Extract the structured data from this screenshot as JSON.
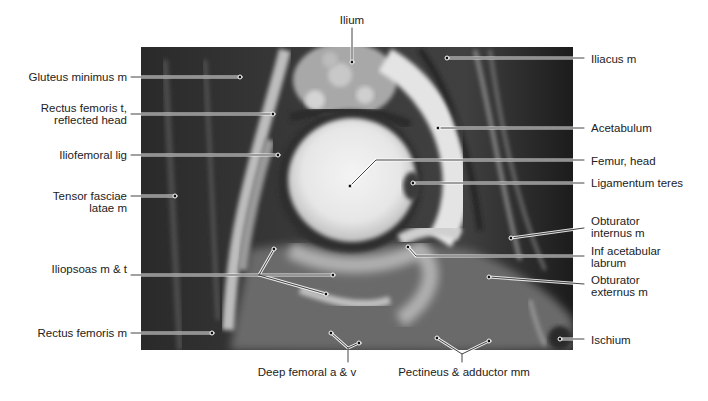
{
  "figure": {
    "type": "MRI coronal hip anatomy",
    "image_box": {
      "x": 141,
      "y": 47,
      "w": 432,
      "h": 303
    },
    "colors": {
      "label_text": "#222222",
      "leader_line": "#444444",
      "leader_halo": "#ffffff",
      "background": "#ffffff"
    }
  },
  "labels": {
    "ilium": "Ilium",
    "gluteus_minimus": "Gluteus minimus m",
    "rectus_femoris_t_1": "Rectus femoris t,",
    "rectus_femoris_t_2": "reflected head",
    "iliofemoral": "Iliofemoral lig",
    "tensor_1": "Tensor fasciae",
    "tensor_2": "latae m",
    "iliopsoas": "Iliopsoas m & t",
    "rectus_femoris_m": "Rectus femoris m",
    "deep_femoral": "Deep femoral a & v",
    "pectineus": "Pectineus & adductor mm",
    "iliacus": "Iliacus m",
    "acetabulum": "Acetabulum",
    "femur_head": "Femur, head",
    "ligamentum_teres": "Ligamentum teres",
    "obturator_int_1": "Obturator",
    "obturator_int_2": "internus m",
    "inf_acetabular_1": "Inf acetabular",
    "inf_acetabular_2": "labrum",
    "obturator_ext_1": "Obturator",
    "obturator_ext_2": "externus m",
    "ischium": "Ischium"
  }
}
